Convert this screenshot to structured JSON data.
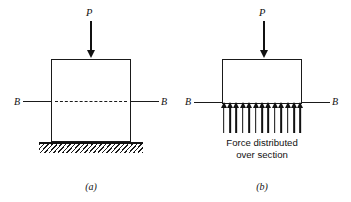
{
  "figure": {
    "background_color": "#ffffff",
    "ink_color": "#111111",
    "width": 351,
    "height": 202
  },
  "panels": [
    {
      "id": "a",
      "caption": "(a)",
      "load_label": "P",
      "section_label_left": "B",
      "section_label_right": "B",
      "section_line_style": "dash-dot",
      "support": "hatched rigid ground",
      "load_direction": "down"
    },
    {
      "id": "b",
      "caption": "(b)",
      "load_label": "P",
      "section_label_left": "B",
      "section_label_right": "B",
      "section_line_style": "solid",
      "distributed_force_note_line1": "Force distributed",
      "distributed_force_note_line2": "over section",
      "distributed_arrow_count": 13,
      "distributed_arrow_direction": "up",
      "load_direction": "down"
    }
  ],
  "chart_data": {
    "type": "diagram",
    "title": "",
    "panels": [
      "(a)",
      "(b)"
    ],
    "annotations": [
      "P",
      "B",
      "B",
      "Force distributed over section"
    ]
  }
}
